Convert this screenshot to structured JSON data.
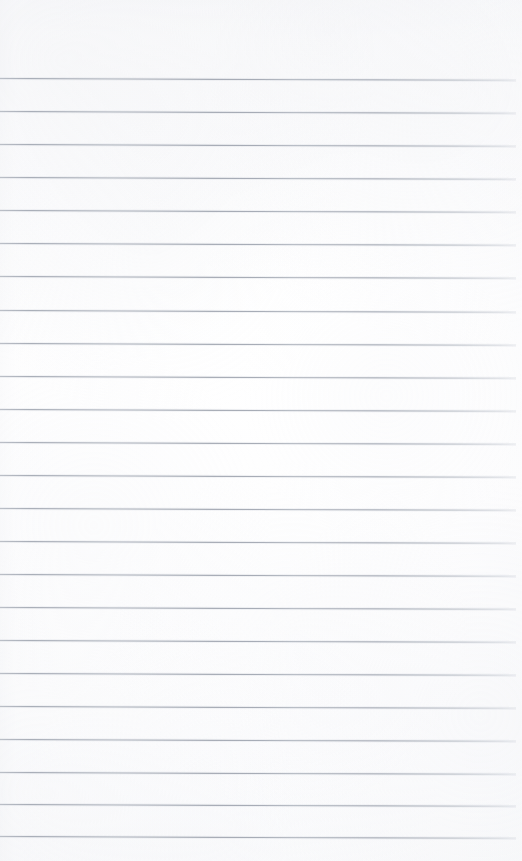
{
  "document": {
    "kind": "scanned-ruled-notebook-page",
    "title": "Blank lined notebook page",
    "has_text": false,
    "has_handwriting": false,
    "page_width": 522,
    "page_height": 861,
    "paper_color": "#fdfdfe",
    "rule_color": "#969caa",
    "top_margin_label": "",
    "header_note": "",
    "footer_note": ""
  },
  "ruling": {
    "style": "wide-ruled horizontal lines",
    "line_count": 24,
    "line_spacing_px": 33,
    "first_line_y": 78,
    "last_line_y": 836,
    "line_start_x": 0,
    "line_end_x": 516,
    "skew_degrees": 0.2,
    "has_vertical_margin_rule": false,
    "lines": [
      {
        "index": 1,
        "y": 78,
        "x_start": 0,
        "x_end": 516
      },
      {
        "index": 2,
        "y": 111,
        "x_start": 0,
        "x_end": 516
      },
      {
        "index": 3,
        "y": 144,
        "x_start": 0,
        "x_end": 516
      },
      {
        "index": 4,
        "y": 177,
        "x_start": 0,
        "x_end": 516
      },
      {
        "index": 5,
        "y": 210,
        "x_start": 0,
        "x_end": 516
      },
      {
        "index": 6,
        "y": 243,
        "x_start": 0,
        "x_end": 516
      },
      {
        "index": 7,
        "y": 276,
        "x_start": 0,
        "x_end": 516
      },
      {
        "index": 8,
        "y": 310,
        "x_start": 0,
        "x_end": 516
      },
      {
        "index": 9,
        "y": 343,
        "x_start": 0,
        "x_end": 516
      },
      {
        "index": 10,
        "y": 376,
        "x_start": 0,
        "x_end": 516
      },
      {
        "index": 11,
        "y": 409,
        "x_start": 0,
        "x_end": 516
      },
      {
        "index": 12,
        "y": 442,
        "x_start": 0,
        "x_end": 516
      },
      {
        "index": 13,
        "y": 475,
        "x_start": 0,
        "x_end": 516
      },
      {
        "index": 14,
        "y": 508,
        "x_start": 0,
        "x_end": 516
      },
      {
        "index": 15,
        "y": 541,
        "x_start": 0,
        "x_end": 516
      },
      {
        "index": 16,
        "y": 574,
        "x_start": 0,
        "x_end": 516
      },
      {
        "index": 17,
        "y": 607,
        "x_start": 0,
        "x_end": 516
      },
      {
        "index": 18,
        "y": 640,
        "x_start": 0,
        "x_end": 516
      },
      {
        "index": 19,
        "y": 673,
        "x_start": 0,
        "x_end": 516
      },
      {
        "index": 20,
        "y": 706,
        "x_start": 0,
        "x_end": 516
      },
      {
        "index": 21,
        "y": 739,
        "x_start": 0,
        "x_end": 516
      },
      {
        "index": 22,
        "y": 772,
        "x_start": 0,
        "x_end": 516
      },
      {
        "index": 23,
        "y": 804,
        "x_start": 0,
        "x_end": 516
      },
      {
        "index": 24,
        "y": 836,
        "x_start": 0,
        "x_end": 516
      }
    ]
  }
}
